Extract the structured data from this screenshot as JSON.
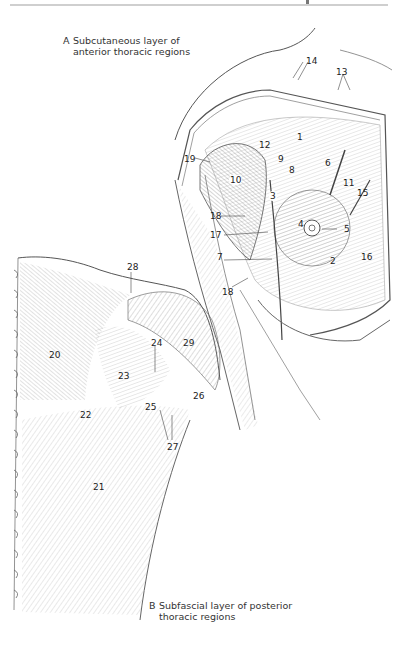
{
  "header": {
    "rule_color": "#cfcfcf"
  },
  "figure_a": {
    "letter": "A",
    "caption_line1": "Subcutaneous layer of",
    "caption_line2": "anterior thoracic regions",
    "labels": [
      {
        "id": "1",
        "text": "1",
        "x": 297,
        "y": 132
      },
      {
        "id": "2",
        "text": "2",
        "x": 330,
        "y": 256
      },
      {
        "id": "3",
        "text": "3",
        "x": 270,
        "y": 192
      },
      {
        "id": "4",
        "text": "4",
        "x": 298,
        "y": 219
      },
      {
        "id": "5",
        "text": "5",
        "x": 344,
        "y": 224
      },
      {
        "id": "6",
        "text": "6",
        "x": 325,
        "y": 158
      },
      {
        "id": "7",
        "text": "7",
        "x": 217,
        "y": 256
      },
      {
        "id": "8",
        "text": "8",
        "x": 288,
        "y": 165
      },
      {
        "id": "9",
        "text": "9",
        "x": 278,
        "y": 155
      },
      {
        "id": "10",
        "text": "10",
        "x": 230,
        "y": 176
      },
      {
        "id": "11",
        "text": "11",
        "x": 343,
        "y": 178
      },
      {
        "id": "12",
        "text": "12",
        "x": 259,
        "y": 140
      },
      {
        "id": "13",
        "text": "13",
        "x": 338,
        "y": 67
      },
      {
        "id": "14",
        "text": "14",
        "x": 308,
        "y": 56
      },
      {
        "id": "15",
        "text": "15",
        "x": 356,
        "y": 188
      },
      {
        "id": "16",
        "text": "16",
        "x": 361,
        "y": 252
      },
      {
        "id": "17",
        "text": "17",
        "x": 213,
        "y": 231
      },
      {
        "id": "18a",
        "text": "18",
        "x": 211,
        "y": 212
      },
      {
        "id": "18b",
        "text": "18",
        "x": 222,
        "y": 287
      },
      {
        "id": "19",
        "text": "19",
        "x": 185,
        "y": 155
      }
    ]
  },
  "figure_b": {
    "letter": "B",
    "caption_line1": "Subfascial layer of posterior",
    "caption_line2": "thoracic regions",
    "labels": [
      {
        "id": "20",
        "text": "20",
        "x": 49,
        "y": 350
      },
      {
        "id": "21",
        "text": "21",
        "x": 93,
        "y": 482
      },
      {
        "id": "22",
        "text": "22",
        "x": 80,
        "y": 410
      },
      {
        "id": "23",
        "text": "23",
        "x": 118,
        "y": 371
      },
      {
        "id": "24",
        "text": "24",
        "x": 151,
        "y": 338
      },
      {
        "id": "25",
        "text": "25",
        "x": 145,
        "y": 402
      },
      {
        "id": "26",
        "text": "26",
        "x": 192,
        "y": 391
      },
      {
        "id": "27",
        "text": "27",
        "x": 167,
        "y": 442
      },
      {
        "id": "28",
        "text": "28",
        "x": 127,
        "y": 262
      },
      {
        "id": "29",
        "text": "29",
        "x": 183,
        "y": 338
      }
    ]
  }
}
